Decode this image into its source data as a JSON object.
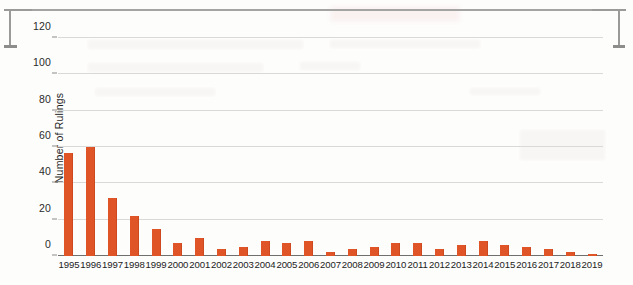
{
  "chart_data": {
    "type": "bar",
    "title": "",
    "xlabel": "",
    "ylabel": "Number of Rulings",
    "ylim": [
      0,
      130
    ],
    "yticks": [
      0,
      20,
      40,
      60,
      80,
      100,
      120
    ],
    "ytick_labels": [
      "0",
      "20",
      "40",
      "60",
      "80",
      "100",
      "120"
    ],
    "grid": true,
    "legend": false,
    "bar_color": "#df5527",
    "categories": [
      "1995",
      "1996",
      "1997",
      "1998",
      "1999",
      "2000",
      "2001",
      "2002",
      "2003",
      "2004",
      "2005",
      "2006",
      "2007",
      "2008",
      "2009",
      "2010",
      "2011",
      "2012",
      "2013",
      "2014",
      "2015",
      "2016",
      "2017",
      "2018",
      "2019"
    ],
    "values": [
      57,
      60,
      32,
      22,
      15,
      7,
      10,
      4,
      5,
      8,
      7,
      8,
      2,
      4,
      5,
      7,
      7,
      4,
      6,
      8,
      6,
      5,
      4,
      2,
      1
    ]
  },
  "artifacts": {
    "scan_bracket_left": "page-edge-bracket",
    "scan_bracket_right": "page-edge-bracket",
    "bleed_through": "reverse-page-ghosting"
  }
}
